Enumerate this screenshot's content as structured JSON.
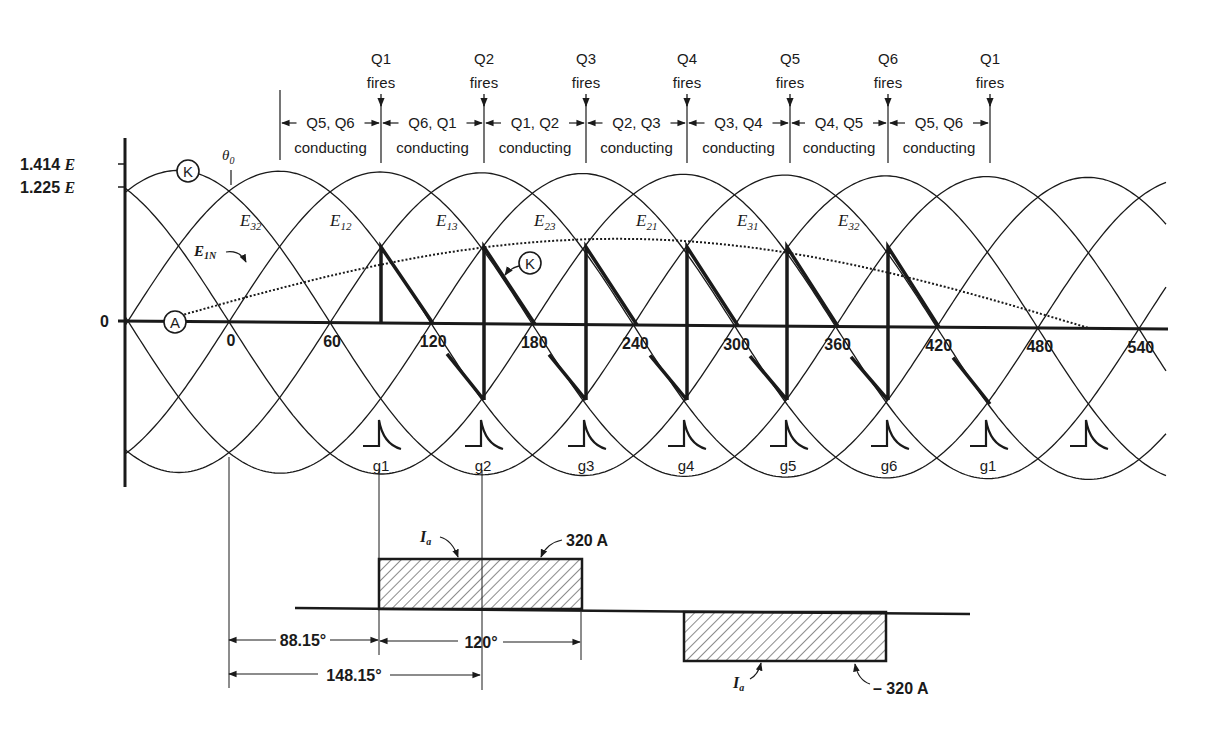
{
  "diagram": {
    "y_axis": {
      "labels": [
        "1.414 E",
        "1.225 E",
        "0"
      ],
      "label_1414": "1.414",
      "label_1225": "1.225",
      "label_zero": "0",
      "unit_symbol": "E"
    },
    "x_axis": {
      "ticks": [
        "0",
        "60",
        "120",
        "180",
        "240",
        "300",
        "360",
        "420",
        "480",
        "540"
      ],
      "unit": "degrees"
    },
    "theta_label": "θ",
    "theta_sub": "0",
    "markers": {
      "K": "K",
      "A": "A"
    },
    "voltage_labels": [
      {
        "main": "E",
        "sub": "32"
      },
      {
        "main": "E",
        "sub": "12"
      },
      {
        "main": "E",
        "sub": "13"
      },
      {
        "main": "E",
        "sub": "23"
      },
      {
        "main": "E",
        "sub": "21"
      },
      {
        "main": "E",
        "sub": "31"
      },
      {
        "main": "E",
        "sub": "32"
      }
    ],
    "phase_voltage_label": {
      "main": "E",
      "sub": "1N"
    },
    "firings": [
      {
        "thyristor": "Q1",
        "text": "fires"
      },
      {
        "thyristor": "Q2",
        "text": "fires"
      },
      {
        "thyristor": "Q3",
        "text": "fires"
      },
      {
        "thyristor": "Q4",
        "text": "fires"
      },
      {
        "thyristor": "Q5",
        "text": "fires"
      },
      {
        "thyristor": "Q6",
        "text": "fires"
      },
      {
        "thyristor": "Q1",
        "text": "fires"
      }
    ],
    "conducting_intervals": [
      {
        "pair": "Q5, Q6",
        "text": "conducting"
      },
      {
        "pair": "Q6, Q1",
        "text": "conducting"
      },
      {
        "pair": "Q1, Q2",
        "text": "conducting"
      },
      {
        "pair": "Q2, Q3",
        "text": "conducting"
      },
      {
        "pair": "Q3, Q4",
        "text": "conducting"
      },
      {
        "pair": "Q4, Q5",
        "text": "conducting"
      },
      {
        "pair": "Q5, Q6",
        "text": "conducting"
      }
    ],
    "gate_pulses": [
      "g1",
      "g2",
      "g3",
      "g4",
      "g5",
      "g6",
      "g1",
      ""
    ],
    "current": {
      "label_main": "I",
      "label_sub": "a",
      "positive_value": "320 A",
      "negative_value": "– 320 A",
      "dim_delay": "88.15°",
      "dim_width": "120°",
      "dim_total": "148.15°"
    },
    "colors": {
      "ink": "#1a1a1a",
      "background": "#ffffff"
    }
  }
}
